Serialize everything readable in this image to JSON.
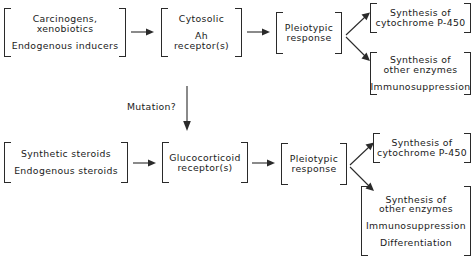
{
  "figure": {
    "type": "flow-diagram",
    "title": "",
    "background_color": "#ffffff",
    "line_color": "#2a2a2a"
  },
  "nodes": {
    "inducers": {
      "name": "inducers-box",
      "lines": [
        "Carcinogens,",
        "xenobiotics",
        "Endogenous  inducers"
      ]
    },
    "ah_receptor": {
      "name": "ah-receptor-box",
      "lines": [
        "Cytosolic",
        "Ah",
        "receptor(s)"
      ]
    },
    "pleiotypic_top": {
      "name": "pleiotypic-response-top-box",
      "lines": [
        "Pleiotypic",
        "response"
      ]
    },
    "p450_top": {
      "name": "cytochrome-p450-top-box",
      "lines": [
        "Synthesis of",
        "cytochrome P-450"
      ]
    },
    "enzymes_top": {
      "name": "other-enzymes-top-box",
      "lines": [
        "Synthesis of",
        "other enzymes",
        "Immunosuppression"
      ]
    },
    "steroids": {
      "name": "steroids-box",
      "lines": [
        "Synthetic steroids",
        "Endogenous  steroids"
      ]
    },
    "gc_receptor": {
      "name": "glucocorticoid-receptor-box",
      "lines": [
        "Glucocorticoid",
        "receptor(s)"
      ]
    },
    "pleiotypic_bottom": {
      "name": "pleiotypic-response-bottom-box",
      "lines": [
        "Pleiotypic",
        "response"
      ]
    },
    "p450_bottom": {
      "name": "cytochrome-p450-bottom-box",
      "lines": [
        "Synthesis of",
        "cytochrome P-450"
      ]
    },
    "enzymes_bottom": {
      "name": "other-enzymes-bottom-box",
      "lines": [
        "Synthesis of",
        "other enzymes",
        "Immunosuppression",
        "Differentiation"
      ]
    }
  },
  "labels": {
    "mutation": "Mutation?"
  },
  "caption": {
    "text": ""
  },
  "edges": [
    {
      "from": "inducers",
      "to": "ah_receptor",
      "style": "horizontal-arrow"
    },
    {
      "from": "ah_receptor",
      "to": "pleiotypic_top",
      "style": "horizontal-arrow"
    },
    {
      "from": "pleiotypic_top",
      "to": "p450_top",
      "style": "diagonal-arrow-up"
    },
    {
      "from": "pleiotypic_top",
      "to": "enzymes_top",
      "style": "diagonal-arrow-down"
    },
    {
      "from": "ah_receptor",
      "to": "gc_receptor",
      "style": "vertical-arrow",
      "label": "Mutation?"
    },
    {
      "from": "steroids",
      "to": "gc_receptor",
      "style": "horizontal-arrow"
    },
    {
      "from": "gc_receptor",
      "to": "pleiotypic_bottom",
      "style": "horizontal-arrow"
    },
    {
      "from": "pleiotypic_bottom",
      "to": "p450_bottom",
      "style": "diagonal-arrow-up"
    },
    {
      "from": "pleiotypic_bottom",
      "to": "enzymes_bottom",
      "style": "diagonal-arrow-down"
    }
  ]
}
